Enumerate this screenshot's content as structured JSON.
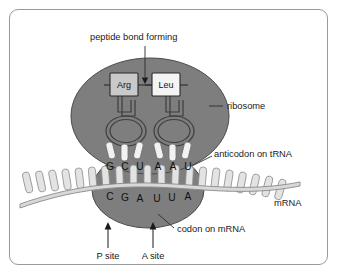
{
  "diagram": {
    "frame_color": "#9a9a9a",
    "background": "#ffffff"
  },
  "colors": {
    "ribosome_fill": "#7e7e7e",
    "ribosome_stroke": "#4a4a4a",
    "mrna_fill": "#d8d8d8",
    "mrna_stroke": "#8a8a8a",
    "base_fill": "#e3e3e3",
    "base_stroke": "#8f8f8f",
    "anticodon_prong_fill": "#f2f2f2",
    "anticodon_prong_stroke": "#6e6e6e",
    "trna_stroke": "#3d3d3d",
    "aa_box_arg_fill": "#c9c9c9",
    "aa_box_leu_fill": "#f4f4f4",
    "aa_box_stroke": "#2b2b2b",
    "text": "#1a1a1a",
    "leader_line": "#2b2b2b"
  },
  "labels": {
    "peptide_bond": "peptide bond forming",
    "ribosome": "ribosome",
    "anticodon": "anticodon on tRNA",
    "codon": "codon on mRNA",
    "mrna": "mRNA",
    "p_site": "P site",
    "a_site": "A site"
  },
  "amino_acids": [
    {
      "name": "Arg",
      "site": "P"
    },
    {
      "name": "Leu",
      "site": "A"
    }
  ],
  "anticodon_bases": [
    {
      "letter": "G",
      "x": 110
    },
    {
      "letter": "C",
      "x": 125
    },
    {
      "letter": "U",
      "x": 140
    },
    {
      "letter": "A",
      "x": 158
    },
    {
      "letter": "A",
      "x": 173
    },
    {
      "letter": "U",
      "x": 188
    }
  ],
  "codon_bases": [
    {
      "letter": "C",
      "x": 110,
      "y": 200
    },
    {
      "letter": "G",
      "x": 125,
      "y": 201
    },
    {
      "letter": "A",
      "x": 140,
      "y": 202
    },
    {
      "letter": "U",
      "x": 157,
      "y": 202
    },
    {
      "letter": "U",
      "x": 172,
      "y": 201
    },
    {
      "letter": "A",
      "x": 188,
      "y": 200
    }
  ],
  "sequences": {
    "anticodon_on_trna": "GCU AAU",
    "codon_on_mrna": "CGA UUA"
  }
}
